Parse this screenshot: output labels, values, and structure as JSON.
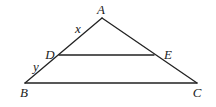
{
  "diagram": {
    "type": "triangle-with-parallel-segment",
    "points": {
      "A": {
        "label": "A",
        "x": 102,
        "y": 18,
        "label_x": 101,
        "label_y": 14
      },
      "B": {
        "label": "B",
        "x": 25,
        "y": 83,
        "label_x": 24,
        "label_y": 97
      },
      "C": {
        "label": "C",
        "x": 197,
        "y": 83,
        "label_x": 197,
        "label_y": 97
      },
      "D": {
        "label": "D",
        "x": 59,
        "y": 55,
        "label_x": 50,
        "label_y": 59
      },
      "E": {
        "label": "E",
        "x": 154,
        "y": 55,
        "label_x": 168,
        "label_y": 59
      }
    },
    "segments": [
      {
        "from": "A",
        "to": "B"
      },
      {
        "from": "A",
        "to": "C"
      },
      {
        "from": "B",
        "to": "C"
      },
      {
        "from": "D",
        "to": "E"
      }
    ],
    "segment_labels": {
      "x": {
        "label": "x",
        "on": "AD",
        "x": 78,
        "y": 33
      },
      "y": {
        "label": "y",
        "on": "DB",
        "x": 36,
        "y": 71
      }
    },
    "colors": {
      "stroke": "#222222",
      "background": "#ffffff"
    }
  }
}
